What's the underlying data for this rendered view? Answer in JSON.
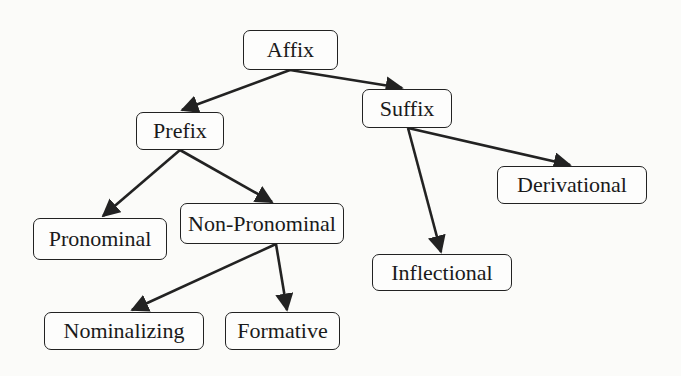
{
  "diagram": {
    "type": "tree",
    "title": "",
    "colors": {
      "stroke": "#222222",
      "text": "#1a1a1a",
      "background": "#fbfbf9"
    },
    "nodes": [
      {
        "id": "affix",
        "label": "Affix",
        "x": 243,
        "y": 30,
        "w": 95,
        "h": 40
      },
      {
        "id": "prefix",
        "label": "Prefix",
        "x": 136,
        "y": 112,
        "w": 88,
        "h": 38
      },
      {
        "id": "suffix",
        "label": "Suffix",
        "x": 362,
        "y": 89,
        "w": 90,
        "h": 39
      },
      {
        "id": "derivational",
        "label": "Derivational",
        "x": 497,
        "y": 166,
        "w": 150,
        "h": 38
      },
      {
        "id": "pronominal",
        "label": "Pronominal",
        "x": 33,
        "y": 218,
        "w": 134,
        "h": 42
      },
      {
        "id": "non-pronominal",
        "label": "Non-Pronominal",
        "x": 180,
        "y": 203,
        "w": 164,
        "h": 41
      },
      {
        "id": "inflectional",
        "label": "Inflectional",
        "x": 372,
        "y": 254,
        "w": 140,
        "h": 37
      },
      {
        "id": "nominalizing",
        "label": "Nominalizing",
        "x": 44,
        "y": 312,
        "w": 160,
        "h": 38
      },
      {
        "id": "formative",
        "label": "Formative",
        "x": 225,
        "y": 312,
        "w": 115,
        "h": 38
      }
    ],
    "edges": [
      {
        "from": "affix",
        "to": "prefix"
      },
      {
        "from": "affix",
        "to": "suffix"
      },
      {
        "from": "prefix",
        "to": "pronominal"
      },
      {
        "from": "prefix",
        "to": "non-pronominal"
      },
      {
        "from": "suffix",
        "to": "derivational"
      },
      {
        "from": "suffix",
        "to": "inflectional"
      },
      {
        "from": "non-pronominal",
        "to": "nominalizing"
      },
      {
        "from": "non-pronominal",
        "to": "formative"
      }
    ]
  }
}
